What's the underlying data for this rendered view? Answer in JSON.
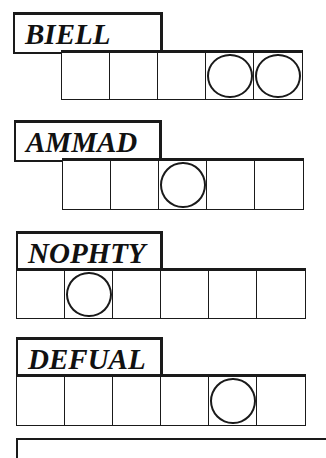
{
  "puzzle": {
    "type": "jumble",
    "words": [
      {
        "scrambled": "BIELL",
        "letter_count": 5,
        "circled_positions": [
          4,
          5
        ],
        "label_box": {
          "x": 13,
          "y": 12,
          "w": 150,
          "h": 42
        },
        "grid": {
          "x": 61,
          "y": 50,
          "cell_w": 48,
          "h": 50
        }
      },
      {
        "scrambled": "AMMAD",
        "letter_count": 5,
        "circled_positions": [
          3
        ],
        "label_box": {
          "x": 14,
          "y": 120,
          "w": 148,
          "h": 42
        },
        "grid": {
          "x": 62,
          "y": 158,
          "cell_w": 48,
          "h": 52
        }
      },
      {
        "scrambled": "NOPHTY",
        "letter_count": 6,
        "circled_positions": [
          2
        ],
        "label_box": {
          "x": 16,
          "y": 231,
          "w": 147,
          "h": 40
        },
        "grid": {
          "x": 16,
          "y": 268,
          "cell_w": 48,
          "h": 51
        }
      },
      {
        "scrambled": "DEFUAL",
        "letter_count": 6,
        "circled_positions": [
          5
        ],
        "label_box": {
          "x": 16,
          "y": 337,
          "w": 147,
          "h": 40
        },
        "grid": {
          "x": 16,
          "y": 374,
          "cell_w": 48,
          "h": 52
        }
      }
    ],
    "colors": {
      "ink": "#1a1a1a",
      "paper": "#ffffff"
    }
  }
}
